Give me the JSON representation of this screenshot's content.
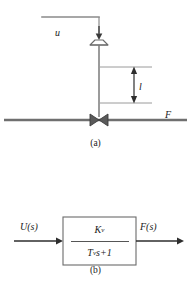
{
  "figure": {
    "panel_a": {
      "caption": "(a)",
      "labels": {
        "control_signal": "u",
        "valve_lift": "l",
        "flow": "F"
      },
      "components": {
        "signal_line": "signal-line",
        "actuator": "diaphragm-actuator",
        "valve_stem": "valve-stem",
        "valve_body": "globe-valve-bowtie",
        "process_pipe": "process-pipe",
        "dimension_arrow": "lift-dimension-arrow",
        "input_arrow": "downward-input-arrow"
      }
    },
    "panel_b": {
      "caption": "(b)",
      "input_label": "U(s)",
      "output_label": "F(s)",
      "transfer_function": {
        "numerator_symbol": "K",
        "numerator_subscript": "v",
        "denominator_symbol": "T",
        "denominator_subscript": "v",
        "denominator_rest": "s+1"
      },
      "components": {
        "block": "transfer-function-block",
        "input_arrow": "input-signal-arrow",
        "output_arrow": "output-signal-arrow"
      }
    },
    "colors": {
      "line": "#6b6b6b",
      "thick_line": "#4a4a4a",
      "text": "#1a1a1a",
      "background": "#ffffff"
    }
  }
}
